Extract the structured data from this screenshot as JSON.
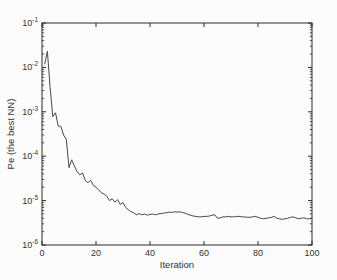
{
  "figure": {
    "background": "#fcfcfc",
    "axis_color": "#2b2b2b",
    "text_color": "#333333"
  },
  "chart_data": {
    "type": "line",
    "title": "",
    "xlabel": "Iteration",
    "ylabel": "Pe (the best NN)",
    "grid": false,
    "legend_position": "none",
    "x_scale": "linear",
    "y_scale": "log",
    "xlim": [
      0,
      100
    ],
    "ylim": [
      1e-06,
      0.1
    ],
    "x_ticks": [
      0,
      20,
      40,
      60,
      80,
      100
    ],
    "y_ticks": [
      {
        "exp": -1,
        "label": "10^-1"
      },
      {
        "exp": -2,
        "label": "10^-2"
      },
      {
        "exp": -3,
        "label": "10^-3"
      },
      {
        "exp": -4,
        "label": "10^-4"
      },
      {
        "exp": -5,
        "label": "10^-5"
      },
      {
        "exp": -6,
        "label": "10^-6"
      }
    ],
    "line_color": "#474747",
    "series_name": "Pe of the best NN per iteration",
    "x": [
      1,
      2,
      3,
      4,
      5,
      6,
      7,
      8,
      9,
      10,
      11,
      12,
      13,
      14,
      15,
      16,
      17,
      18,
      19,
      20,
      21,
      22,
      23,
      24,
      25,
      26,
      27,
      28,
      29,
      30,
      31,
      32,
      33,
      34,
      35,
      36,
      37,
      38,
      39,
      40,
      41,
      42,
      43,
      44,
      45,
      46,
      47,
      48,
      49,
      50,
      51,
      52,
      53,
      54,
      55,
      56,
      57,
      58,
      59,
      60,
      61,
      62,
      63,
      64,
      65,
      66,
      67,
      68,
      69,
      70,
      71,
      72,
      73,
      74,
      75,
      76,
      77,
      78,
      79,
      80,
      81,
      82,
      83,
      84,
      85,
      86,
      87,
      88,
      89,
      90,
      91,
      92,
      93,
      94,
      95,
      96,
      97,
      98,
      99,
      100
    ],
    "values": [
      0.012,
      0.023,
      0.0035,
      0.00078,
      0.00095,
      0.00048,
      0.00047,
      0.0003,
      0.00024,
      5.5e-05,
      8.3e-05,
      6e-05,
      4.5e-05,
      3.8e-05,
      4.2e-05,
      2.9e-05,
      2.5e-05,
      2.9e-05,
      2.2e-05,
      2e-05,
      1.75e-05,
      1.5e-05,
      1.4e-05,
      1.25e-05,
      1e-05,
      1.1e-05,
      9.2e-06,
      1.05e-05,
      8.2e-06,
      9e-06,
      7e-06,
      6.2e-06,
      5.6e-06,
      5.3e-06,
      4.8e-06,
      5.1e-06,
      4.8e-06,
      5e-06,
      4.7e-06,
      4.9e-06,
      5e-06,
      4.8e-06,
      5e-06,
      5.1e-06,
      5.2e-06,
      5.3e-06,
      5.5e-06,
      5.4e-06,
      5.6e-06,
      5.5e-06,
      5.6e-06,
      5.4e-06,
      5.2e-06,
      4.9e-06,
      4.7e-06,
      4.5e-06,
      4.4e-06,
      4.3e-06,
      4.3e-06,
      4.4e-06,
      4.4e-06,
      4.5e-06,
      4.7e-06,
      4.8e-06,
      4e-06,
      4.1e-06,
      4.3e-06,
      4.3e-06,
      4.4e-06,
      4.3e-06,
      4.3e-06,
      4.4e-06,
      4.4e-06,
      4.3e-06,
      4.3e-06,
      4.2e-06,
      4.2e-06,
      4.3e-06,
      4.4e-06,
      4.2e-06,
      4e-06,
      3.9e-06,
      4e-06,
      4.1e-06,
      4.2e-06,
      4.4e-06,
      4e-06,
      3.9e-06,
      3.8e-06,
      3.9e-06,
      4e-06,
      4.2e-06,
      4.3e-06,
      4.1e-06,
      3.9e-06,
      4e-06,
      4.1e-06,
      3.9e-06,
      3.9e-06,
      4e-06
    ]
  }
}
